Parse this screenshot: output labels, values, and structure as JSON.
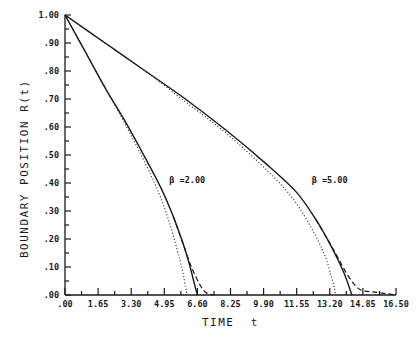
{
  "chart_data": {
    "type": "line",
    "title": "",
    "xlabel": "TIME  t",
    "ylabel": "BOUNDARY POSITION R(t)",
    "xlim": [
      0,
      16.5
    ],
    "ylim": [
      0,
      1.0
    ],
    "grid": false,
    "legend": "none (curves annotated inline)",
    "x_ticks": [
      ".00",
      "1.65",
      "3.30",
      "4.95",
      "6.60",
      "8.25",
      "9.90",
      "11.55",
      "13.20",
      "14.85",
      "16.50"
    ],
    "y_ticks": [
      ".00",
      ".10",
      ".20",
      ".30",
      ".40",
      ".50",
      ".60",
      ".70",
      ".80",
      ".90",
      "1.00"
    ],
    "annotations": [
      {
        "text": "β =2.00",
        "x": 5.2,
        "y": 0.4
      },
      {
        "text": "β =5.00",
        "x": 12.3,
        "y": 0.4
      }
    ],
    "series": [
      {
        "name": "beta=2.00 solid",
        "style": "solid",
        "x": [
          0,
          1.0,
          2.0,
          3.0,
          4.0,
          4.8,
          5.4,
          5.9,
          6.2,
          6.45,
          6.6
        ],
        "y": [
          1.0,
          0.87,
          0.74,
          0.62,
          0.49,
          0.38,
          0.28,
          0.18,
          0.11,
          0.04,
          0.0
        ]
      },
      {
        "name": "beta=2.00 dotted",
        "style": "dotted",
        "x": [
          0,
          1.0,
          2.0,
          3.0,
          4.0,
          4.7,
          5.2,
          5.6,
          5.85,
          6.0,
          6.1
        ],
        "y": [
          1.0,
          0.87,
          0.74,
          0.61,
          0.47,
          0.36,
          0.26,
          0.16,
          0.09,
          0.03,
          0.0
        ]
      },
      {
        "name": "beta=2.00 dashed",
        "style": "dashed",
        "x": [
          5.4,
          5.9,
          6.3,
          6.7,
          7.0,
          7.4
        ],
        "y": [
          0.28,
          0.18,
          0.1,
          0.04,
          0.01,
          0.0
        ]
      },
      {
        "name": "beta=5.00 solid",
        "style": "solid",
        "x": [
          0,
          2.0,
          4.0,
          6.0,
          8.0,
          10.0,
          11.5,
          12.5,
          13.3,
          13.9,
          14.3
        ],
        "y": [
          1.0,
          0.9,
          0.8,
          0.7,
          0.59,
          0.47,
          0.37,
          0.27,
          0.17,
          0.08,
          0.0
        ]
      },
      {
        "name": "beta=5.00 dotted",
        "style": "dotted",
        "x": [
          0,
          2.0,
          4.0,
          6.0,
          8.0,
          10.0,
          11.3,
          12.2,
          12.9,
          13.3,
          13.5
        ],
        "y": [
          1.0,
          0.9,
          0.8,
          0.69,
          0.58,
          0.45,
          0.35,
          0.25,
          0.15,
          0.06,
          0.0
        ]
      },
      {
        "name": "beta=5.00 dashed",
        "style": "dashed",
        "x": [
          12.5,
          13.4,
          14.1,
          14.7,
          15.5,
          16.5
        ],
        "y": [
          0.27,
          0.16,
          0.07,
          0.02,
          0.01,
          0.0
        ]
      }
    ]
  }
}
